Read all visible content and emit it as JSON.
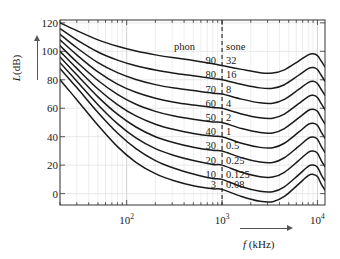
{
  "chart_data": {
    "type": "line",
    "title": "",
    "xlabel": "f (kHz)",
    "ylabel": "L (dB)",
    "xscale": "log",
    "xlim": [
      20,
      12000
    ],
    "ylim": [
      -8,
      122
    ],
    "grid": true,
    "x_ticks": [
      {
        "value": 100,
        "label": "10",
        "exp": "2"
      },
      {
        "value": 1000,
        "label": "10",
        "exp": "3"
      },
      {
        "value": 10000,
        "label": "10",
        "exp": "4"
      }
    ],
    "y_ticks": [
      0,
      20,
      40,
      60,
      80,
      100,
      120
    ],
    "reference_line": {
      "x": 1000,
      "style": "dashed"
    },
    "legend_headers": {
      "left": "phon",
      "right": "sone"
    },
    "series": [
      {
        "name": "90 phon",
        "phon": "90",
        "sone": "32",
        "x": [
          20,
          30,
          50,
          80,
          125,
          200,
          315,
          500,
          800,
          1000,
          1600,
          2500,
          3400,
          4500,
          6300,
          8000,
          9000,
          10000,
          11000,
          12000
        ],
        "y": [
          120.0,
          114.5,
          108.0,
          103.5,
          100.2,
          97.5,
          95.4,
          93.6,
          91.3,
          90.0,
          87.3,
          85.0,
          84.8,
          87.0,
          93.0,
          97.5,
          98.3,
          97.0,
          93.0,
          89.0
        ]
      },
      {
        "name": "80 phon",
        "phon": "80",
        "sone": "16",
        "x": [
          20,
          30,
          50,
          80,
          125,
          200,
          315,
          500,
          800,
          1000,
          1600,
          2500,
          3400,
          4500,
          6300,
          8000,
          9000,
          10000,
          11000,
          12000
        ],
        "y": [
          116.0,
          108.0,
          99.5,
          93.8,
          89.8,
          86.8,
          84.6,
          82.8,
          80.8,
          80.0,
          76.8,
          74.3,
          74.0,
          76.5,
          83.0,
          87.8,
          88.6,
          87.2,
          83.0,
          79.0
        ]
      },
      {
        "name": "70 phon",
        "phon": "70",
        "sone": "8",
        "x": [
          20,
          30,
          50,
          80,
          125,
          200,
          315,
          500,
          800,
          1000,
          1600,
          2500,
          3400,
          4500,
          6300,
          8000,
          9000,
          10000,
          11000,
          12000
        ],
        "y": [
          112.0,
          102.5,
          92.0,
          85.0,
          80.2,
          76.6,
          74.2,
          72.4,
          70.6,
          70.0,
          66.4,
          63.8,
          63.5,
          66.2,
          73.0,
          78.0,
          78.9,
          77.4,
          73.0,
          69.0
        ]
      },
      {
        "name": "60 phon",
        "phon": "60",
        "sone": "4",
        "x": [
          20,
          30,
          50,
          80,
          125,
          200,
          315,
          500,
          800,
          1000,
          1600,
          2500,
          3400,
          4500,
          6300,
          8000,
          9000,
          10000,
          11000,
          12000
        ],
        "y": [
          108.0,
          97.5,
          85.5,
          77.0,
          71.2,
          67.0,
          64.2,
          62.2,
          60.5,
          60.0,
          56.0,
          53.3,
          53.0,
          55.9,
          63.0,
          68.2,
          69.1,
          67.6,
          63.0,
          59.0
        ]
      },
      {
        "name": "50 phon",
        "phon": "50",
        "sone": "2",
        "x": [
          20,
          30,
          50,
          80,
          125,
          200,
          315,
          500,
          800,
          1000,
          1600,
          2500,
          3400,
          4500,
          6300,
          8000,
          9000,
          10000,
          11000,
          12000
        ],
        "y": [
          104.0,
          92.5,
          79.5,
          69.8,
          62.8,
          57.8,
          54.5,
          52.2,
          50.4,
          50.0,
          45.7,
          42.9,
          42.6,
          45.7,
          53.0,
          58.4,
          59.3,
          57.8,
          53.0,
          49.0
        ]
      },
      {
        "name": "40 phon",
        "phon": "40",
        "sone": "1",
        "x": [
          20,
          30,
          50,
          80,
          125,
          200,
          315,
          500,
          800,
          1000,
          1600,
          2500,
          3400,
          4500,
          6300,
          8000,
          9000,
          10000,
          11000,
          12000
        ],
        "y": [
          100.0,
          88.0,
          73.5,
          62.6,
          54.6,
          48.8,
          45.0,
          42.3,
          40.4,
          40.0,
          35.4,
          32.5,
          32.2,
          35.4,
          43.0,
          48.6,
          49.5,
          48.0,
          43.0,
          39.0
        ]
      },
      {
        "name": "30 phon",
        "phon": "30",
        "sone": "0.5",
        "x": [
          20,
          30,
          50,
          80,
          125,
          200,
          315,
          500,
          800,
          1000,
          1600,
          2500,
          3400,
          4500,
          6300,
          8000,
          9000,
          10000,
          11000,
          12000
        ],
        "y": [
          96.0,
          83.5,
          68.0,
          55.8,
          46.8,
          40.0,
          35.8,
          32.6,
          30.4,
          30.0,
          25.2,
          22.2,
          21.9,
          25.2,
          33.0,
          38.8,
          39.7,
          38.2,
          33.0,
          29.0
        ]
      },
      {
        "name": "20 phon",
        "phon": "20",
        "sone": "0.25",
        "x": [
          20,
          30,
          50,
          80,
          125,
          200,
          315,
          500,
          800,
          1000,
          1600,
          2500,
          3400,
          4500,
          6300,
          8000,
          9000,
          10000,
          11000,
          12000
        ],
        "y": [
          92.0,
          79.0,
          62.5,
          49.2,
          39.2,
          31.6,
          26.8,
          23.2,
          20.5,
          20.0,
          15.0,
          11.9,
          11.6,
          15.0,
          23.0,
          29.0,
          29.9,
          28.4,
          23.0,
          19.0
        ]
      },
      {
        "name": "10 phon",
        "phon": "10",
        "sone": "0.125",
        "x": [
          20,
          30,
          50,
          80,
          125,
          200,
          315,
          500,
          800,
          1000,
          1600,
          2500,
          3400,
          4500,
          6300,
          8000,
          9000,
          10000,
          11000,
          12000
        ],
        "y": [
          88.0,
          74.5,
          57.0,
          42.6,
          31.6,
          23.2,
          17.8,
          13.8,
          10.6,
          10.0,
          4.8,
          1.6,
          1.3,
          4.8,
          13.0,
          19.2,
          20.1,
          18.6,
          13.0,
          9.0
        ]
      },
      {
        "name": "3 phon (threshold)",
        "phon": "3",
        "sone": "0.08",
        "x": [
          20,
          30,
          50,
          80,
          125,
          200,
          315,
          500,
          800,
          1000,
          1600,
          2500,
          3400,
          4500,
          6300,
          8000,
          9000,
          10000,
          11000,
          12000
        ],
        "y": [
          80.0,
          66.0,
          48.0,
          33.0,
          22.0,
          14.0,
          9.0,
          5.5,
          3.4,
          3.0,
          -2.0,
          -5.4,
          -5.7,
          -2.0,
          6.5,
          12.6,
          13.5,
          12.0,
          6.5,
          2.5
        ]
      }
    ]
  },
  "axes": {
    "y_label_text": "L",
    "y_label_unit": "(dB)",
    "x_label_text": "f",
    "x_label_unit": "(kHz)"
  }
}
